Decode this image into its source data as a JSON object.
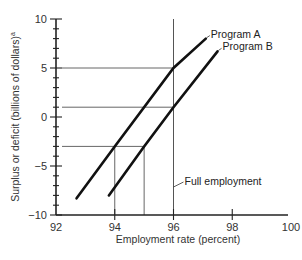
{
  "chart_data": {
    "type": "line",
    "title": "",
    "xlabel": "Employment rate (percent)",
    "ylabel": "Surplus or deficit (billions of dollars)",
    "ylabel_superscript": "a",
    "xlim": [
      92,
      100
    ],
    "ylim": [
      -10,
      10
    ],
    "x_ticks": [
      92,
      94,
      96,
      98,
      100
    ],
    "y_ticks": [
      -10,
      -5,
      0,
      5,
      10
    ],
    "x_tick_labels": [
      "92",
      "94",
      "96",
      "98",
      "100"
    ],
    "y_tick_labels": [
      "−10",
      "−5",
      "0",
      "5",
      "10"
    ],
    "grid": false,
    "series": [
      {
        "name": "Program A",
        "x": [
          92.7,
          94,
          96,
          97.1
        ],
        "y": [
          -8.3,
          -3,
          5,
          8
        ]
      },
      {
        "name": "Program B",
        "x": [
          93.8,
          95,
          96,
          97.5
        ],
        "y": [
          -8,
          -3,
          1,
          6.7
        ]
      }
    ],
    "reference_lines": [
      {
        "type": "vertical",
        "x": 96,
        "label": "Full employment"
      },
      {
        "type": "guide-horizontal",
        "y": 5,
        "x_to": 96
      },
      {
        "type": "guide-horizontal",
        "y": 1,
        "x_to": 96
      },
      {
        "type": "guide-horizontal",
        "y": -3,
        "x_to": 95
      },
      {
        "type": "guide-vertical",
        "x": 94,
        "y_from": -3
      },
      {
        "type": "guide-vertical",
        "x": 95,
        "y_from": -3
      }
    ],
    "annotations": [
      {
        "text": "Full employment",
        "points_to": "vertical line at x=96"
      }
    ]
  }
}
